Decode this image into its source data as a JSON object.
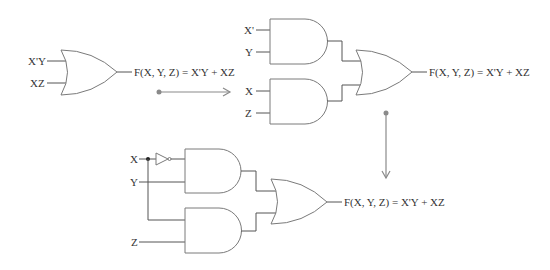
{
  "diagram": {
    "colors": {
      "gate_stroke": "#7a7a7a",
      "wire": "#555555",
      "arrow": "#8a8a8a",
      "text": "#333333"
    },
    "stage1": {
      "inputs": [
        "X'Y",
        "XZ"
      ],
      "gate": "OR",
      "output": "F(X, Y, Z) = X'Y + XZ"
    },
    "stage2": {
      "and_gate_1_inputs": [
        "X'",
        "Y"
      ],
      "and_gate_2_inputs": [
        "X",
        "Z"
      ],
      "gate": "OR",
      "output": "F(X, Y, Z) = X'Y + XZ"
    },
    "stage3": {
      "inputs": [
        "X",
        "Y",
        "Z"
      ],
      "not_gate": "NOT",
      "output": "F(X, Y, Z) = X'Y + XZ"
    },
    "arrows": [
      "stage1-to-stage2",
      "stage2-to-stage3"
    ]
  }
}
